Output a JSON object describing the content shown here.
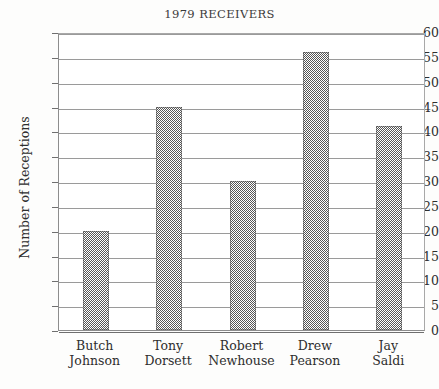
{
  "chart_data": {
    "type": "bar",
    "title": "1979 RECEIVERS",
    "xlabel": "",
    "ylabel": "Number of Receptions",
    "ylim": [
      0,
      60
    ],
    "ytick_step": 5,
    "yticks": [
      0,
      5,
      10,
      15,
      20,
      25,
      30,
      35,
      40,
      45,
      50,
      55,
      60
    ],
    "ytick_labels": [
      "0",
      "5",
      "10",
      "15",
      "20",
      "25",
      "30",
      "35",
      "40",
      "45",
      "50",
      "55",
      "60"
    ],
    "grid": true,
    "legend": null,
    "categories": [
      "Butch Johnson",
      "Tony Dorsett",
      "Robert Newhouse",
      "Drew Pearson",
      "Jay Saldi"
    ],
    "category_lines": [
      [
        "Butch",
        "Johnson"
      ],
      [
        "Tony",
        "Dorsett"
      ],
      [
        "Robert",
        "Newhouse"
      ],
      [
        "Drew",
        "Pearson"
      ],
      [
        "Jay",
        "Saldi"
      ]
    ],
    "values": [
      20,
      45,
      30,
      56,
      41
    ],
    "bar_color": "#565656",
    "bar_fill": "checkerboard-dither",
    "gridline_color": "#9a9a9a",
    "axis_color": "#6f6f6f",
    "background_color": "#fdfdfc",
    "plot_background_color": "#ffffff"
  }
}
